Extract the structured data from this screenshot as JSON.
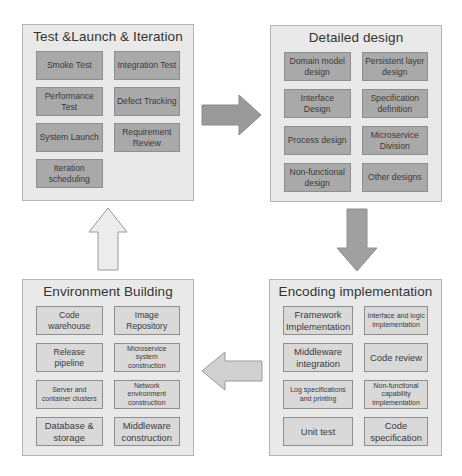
{
  "panels": {
    "test_launch_iteration": {
      "title": "Test &Launch & Iteration",
      "items": [
        "Smoke Test",
        "Integration Test",
        "Performance Test",
        "Defect Tracking",
        "System Launch",
        "Requirement Review",
        "Iteration scheduling"
      ]
    },
    "detailed_design": {
      "title": "Detailed design",
      "items": [
        "Domain model design",
        "Persistent layer design",
        "Interface Design",
        "Specification definition",
        "Process design",
        "Microservice Division",
        "Non-functional design",
        "Other designs"
      ]
    },
    "environment_building": {
      "title": "Environment Building",
      "items": [
        "Code warehouse",
        "Image Repository",
        "Release pipeline",
        "Microservice system construction",
        "Server and container clusters",
        "Network environment construction",
        "Database & storage",
        "Middleware construction"
      ]
    },
    "encoding_implementation": {
      "title": "Encoding implementation",
      "items": [
        "Framework Implementation",
        "Interface and logic implementation",
        "Middleware integration",
        "Code review",
        "Log specifications and printing",
        "Non-functional capability implementation",
        "Unit test",
        "Code specification"
      ]
    }
  },
  "arrows": [
    {
      "from": "Test &Launch & Iteration",
      "to": "Detailed design",
      "direction": "right",
      "fill": "#9a9a9a"
    },
    {
      "from": "Detailed design",
      "to": "Encoding implementation",
      "direction": "down",
      "fill": "#a0a0a0"
    },
    {
      "from": "Encoding implementation",
      "to": "Environment Building",
      "direction": "left",
      "fill": "#d0d0d0"
    },
    {
      "from": "Environment Building",
      "to": "Test &Launch & Iteration",
      "direction": "up",
      "fill": "#ececec"
    }
  ],
  "colors": {
    "panel_bg": "#e9e9e9",
    "panel_border": "#b5b5b5",
    "box_dark": "#a9a9a9",
    "box_light": "#d9d9d9",
    "box_border": "#8e8e8e",
    "text": "#3a3a3a"
  }
}
